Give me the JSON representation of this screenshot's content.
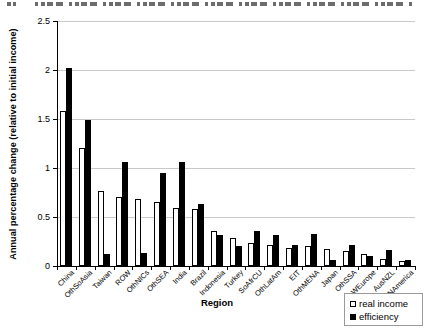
{
  "chart_data": {
    "type": "bar",
    "title": "",
    "xlabel": "Region",
    "ylabel": "Annual percentage change (relative to initial income)",
    "ylim": [
      0,
      2.5
    ],
    "ytick_interval": 0.5,
    "grid": true,
    "legend_position": "bottom-right below plot",
    "categories": [
      "China",
      "OthSoAsia",
      "Taiwan",
      "ROW",
      "OthNICs",
      "OthSEA",
      "India",
      "Brazil",
      "Indonesia",
      "Turkey",
      "SoAfrCU",
      "OthLatAm",
      "EIT",
      "OthMENA",
      "Japan",
      "OthSSA",
      "WEurope",
      "AusNZL",
      "NAmerica"
    ],
    "series": [
      {
        "name": "real income",
        "fill": "#ffffff",
        "border": "#000000",
        "values": [
          1.58,
          1.2,
          0.76,
          0.7,
          0.68,
          0.65,
          0.59,
          0.58,
          0.36,
          0.29,
          0.23,
          0.21,
          0.18,
          0.2,
          0.17,
          0.15,
          0.12,
          0.07,
          0.05
        ]
      },
      {
        "name": "efficiency",
        "fill": "#000000",
        "border": "#000000",
        "values": [
          2.02,
          1.49,
          0.12,
          1.06,
          0.13,
          0.95,
          1.06,
          0.63,
          0.32,
          0.2,
          0.36,
          0.32,
          0.21,
          0.33,
          0.06,
          0.21,
          0.1,
          0.16,
          0.06
        ]
      }
    ]
  }
}
